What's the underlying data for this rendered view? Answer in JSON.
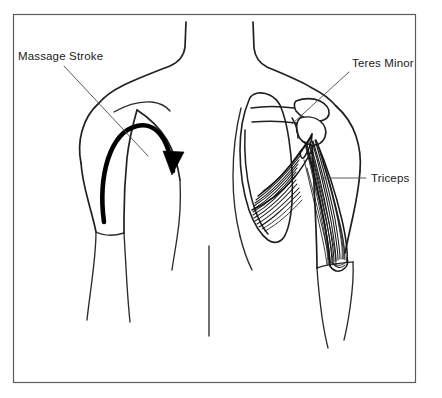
{
  "figure": {
    "background_color": "#ffffff",
    "line_color": "#231f20",
    "frame": {
      "name": "diagram-border",
      "color": "#5c5c5c",
      "x": 13,
      "y": 14,
      "width": 403,
      "height": 369
    }
  },
  "annotations": [
    {
      "id": "massage-stroke",
      "label": "Massage Stroke",
      "text_x": 18,
      "text_y": 60,
      "leader": "M 64 66 L 148 156",
      "side": "left"
    },
    {
      "id": "teres-minor",
      "label": "Teres Minor",
      "text_x": 352,
      "text_y": 67,
      "leader": "M 349 72 L 292 124",
      "side": "right"
    },
    {
      "id": "triceps",
      "label": "Triceps",
      "text_x": 371,
      "text_y": 182,
      "leader": "M 366 178 L 322 178",
      "side": "right"
    }
  ],
  "figures": {
    "left": {
      "name": "left-torso-back-view",
      "description": "Back view of left shoulder and arm with massage stroke arrow"
    },
    "right": {
      "name": "right-torso-anatomy-view",
      "description": "Back view of right shoulder showing scapula, teres minor and triceps musculature"
    }
  },
  "arrow": {
    "name": "massage-stroke-arrow",
    "color": "#000000",
    "direction": "upward along arm then arcing over shoulder and down",
    "stroke_width": 4.6
  },
  "anatomy": {
    "bones": [
      {
        "name": "scapula",
        "label": "scapula"
      },
      {
        "name": "scapular-spine",
        "label": "spine of scapula"
      },
      {
        "name": "acromion",
        "label": "acromion"
      },
      {
        "name": "humeral-head",
        "label": "head of humerus"
      }
    ],
    "muscles": [
      {
        "name": "teres-minor",
        "label": "Teres Minor",
        "fiber_count": 14
      },
      {
        "name": "triceps",
        "label": "Triceps",
        "fiber_count": 18
      }
    ]
  }
}
